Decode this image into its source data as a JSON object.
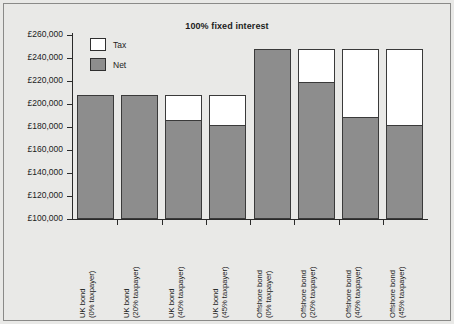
{
  "chart_data": {
    "type": "bar",
    "title": "100% fixed interest",
    "xlabel": "",
    "ylabel": "",
    "stacked": true,
    "grid": false,
    "legend_position": "top-left-inside",
    "ylim": [
      100000,
      260000
    ],
    "ytick_values": [
      100000,
      120000,
      140000,
      160000,
      180000,
      200000,
      220000,
      240000,
      260000
    ],
    "ytick_labels": [
      "£100,000",
      "£120,000",
      "£140,000",
      "£160,000",
      "£180,000",
      "£200,000",
      "£220,000",
      "£240,000",
      "£260,000"
    ],
    "categories": [
      "UK bond (0% taxpayer)",
      "UK bond (20% taxpayer)",
      "UK bond (40% taxpayer)",
      "UK bond (45% taxpayer)",
      "Offshore bond (0% taxpayer)",
      "Offshore bond (20% taxpayer)",
      "Offshore bond (40% taxpayer)",
      "Offshore bond (45% taxpayer)"
    ],
    "category_lines": [
      [
        "UK bond",
        "(0% taxpayer)"
      ],
      [
        "UK bond",
        "(20% taxpayer)"
      ],
      [
        "UK bond",
        "(40% taxpayer)"
      ],
      [
        "UK bond",
        "(45% taxpayer)"
      ],
      [
        "Offshore bond",
        "(0% taxpayer)"
      ],
      [
        "Offshore bond",
        "(20% taxpayer)"
      ],
      [
        "Offshore bond",
        "(40% taxpayer)"
      ],
      [
        "Offshore bond",
        "(45% taxpayer)"
      ]
    ],
    "series": [
      {
        "name": "Net",
        "color": "#8d8d8d",
        "values": [
          208000,
          208000,
          186500,
          182000,
          248000,
          219000,
          189000,
          182000
        ]
      },
      {
        "name": "Tax",
        "color": "#ffffff",
        "values": [
          0,
          0,
          21500,
          26000,
          0,
          29000,
          59000,
          66000
        ]
      }
    ],
    "totals": [
      208000,
      208000,
      208000,
      208000,
      248000,
      248000,
      248000,
      248000
    ]
  },
  "legend": {
    "items": [
      {
        "label": "Tax",
        "color": "#ffffff"
      },
      {
        "label": "Net",
        "color": "#8d8d8d"
      }
    ]
  },
  "colors": {
    "background": "#e9e9e7",
    "net": "#8d8d8d",
    "tax": "#ffffff",
    "axis": "#2a2a2a",
    "text": "#1c1c1c",
    "border": "#8a8a88"
  }
}
